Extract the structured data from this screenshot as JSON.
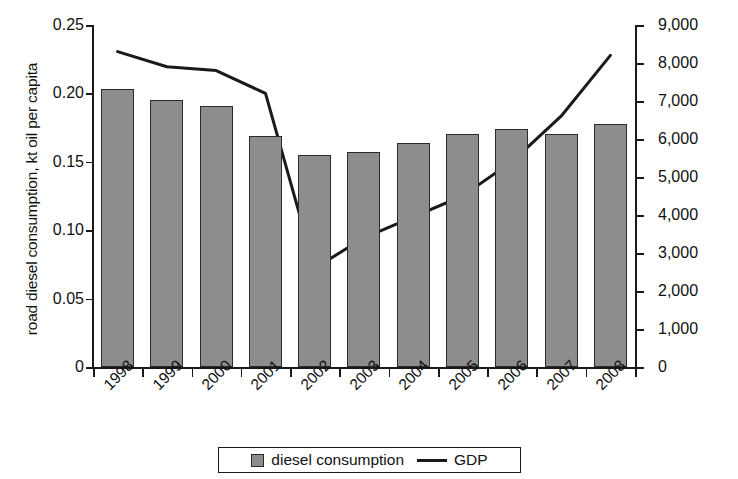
{
  "chart_data": {
    "type": "bar",
    "title": "",
    "xlabel": "",
    "ylabel": "road diesel consumption, kt oil per capita",
    "y2label": "GDP, US$ per capita",
    "categories": [
      "1998",
      "1999",
      "2000",
      "2001",
      "2002",
      "2003",
      "2004",
      "2005",
      "2006",
      "2007",
      "2008"
    ],
    "ylim": [
      0,
      0.25
    ],
    "y2lim": [
      0,
      9000
    ],
    "ytick_labels": [
      "0",
      "0.05",
      "0.10",
      "0.15",
      "0.20",
      "0.25"
    ],
    "ytick_values": [
      0,
      0.05,
      0.1,
      0.15,
      0.2,
      0.25
    ],
    "y2tick_labels": [
      "0",
      "1,000",
      "2,000",
      "3,000",
      "4,000",
      "5,000",
      "6,000",
      "7,000",
      "8,000",
      "9,000"
    ],
    "y2tick_values": [
      0,
      1000,
      2000,
      3000,
      4000,
      5000,
      6000,
      7000,
      8000,
      9000
    ],
    "grid": false,
    "legend_position": "bottom",
    "series": [
      {
        "name": "diesel consumption",
        "type": "bar",
        "axis": "left",
        "color": "#8d8d8d",
        "edge_color": "#2b2b2b",
        "values": [
          0.203,
          0.195,
          0.191,
          0.169,
          0.155,
          0.157,
          0.164,
          0.17,
          0.174,
          0.17,
          0.178
        ]
      },
      {
        "name": "GDP",
        "type": "line",
        "axis": "right",
        "color": "#1a1a1a",
        "values": [
          8300,
          7900,
          7800,
          7200,
          2600,
          3400,
          3950,
          4500,
          5400,
          6600,
          8200
        ]
      }
    ]
  },
  "legend": {
    "items": [
      {
        "label": "diesel consumption",
        "marker": "square-swatch"
      },
      {
        "label": "GDP",
        "marker": "line-swatch"
      }
    ]
  }
}
